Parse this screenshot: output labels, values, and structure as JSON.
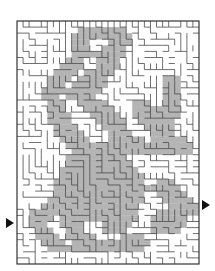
{
  "puzzle": {
    "type": "maze",
    "figure": "hidden picture silhouette (shaded solution path)",
    "frame": {
      "x": 17,
      "y": 21,
      "width": 182,
      "height": 243
    },
    "cell_size": 6,
    "cols": 30,
    "rows": 40,
    "colors": {
      "background": "#ffffff",
      "wall": "#4a4a4a",
      "outer_wall": "#333333",
      "shade": "#b4b4b4",
      "arrow": "#111111"
    },
    "entry": {
      "side": "left",
      "y": 223,
      "icon": "arrow-right-icon"
    },
    "exit": {
      "side": "right",
      "y": 205,
      "icon": "arrow-right-icon"
    }
  }
}
